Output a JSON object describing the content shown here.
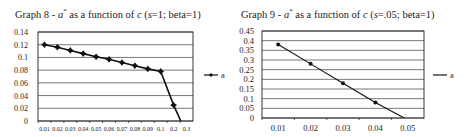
{
  "chart_data": [
    {
      "type": "line",
      "title": "Graph 8 - a* as a function of c (s=1; beta=1)",
      "title_parts": {
        "prefix": "Graph 8 - ",
        "var": "a",
        "sup": "*",
        "mid": " as a function of ",
        "cvar": "c",
        "paren_open": " (",
        "svar": "s",
        "params": "=1; beta=1)"
      },
      "xlabel": "",
      "ylabel": "",
      "categories": [
        "0.01",
        "0.02",
        "0.03",
        "0.04",
        "0.05",
        "0.06",
        "0.07",
        "0.08",
        "0.09",
        "0.1",
        "0.2",
        "0.3"
      ],
      "series": [
        {
          "name": "a",
          "values": [
            0.12,
            0.116,
            0.111,
            0.106,
            0.101,
            0.097,
            0.092,
            0.087,
            0.082,
            0.078,
            0.025,
            -0.02
          ]
        }
      ],
      "yticks": [
        "0",
        "0.02",
        "0.04",
        "0.06",
        "0.08",
        "0.1",
        "0.12",
        "0.14"
      ],
      "ylim": [
        0,
        0.14
      ],
      "grid": true,
      "legend_position": "right"
    },
    {
      "type": "line",
      "title": "Graph 9 - a* as a function of c (s=.05; beta=1)",
      "title_parts": {
        "prefix": "Graph 9 - ",
        "var": "a",
        "sup": "*",
        "mid": " as a function of ",
        "cvar": "c",
        "paren_open": " (",
        "svar": "s",
        "params": "=.05; beta=1)"
      },
      "xlabel": "",
      "ylabel": "",
      "categories": [
        "0.01",
        "0.02",
        "0.03",
        "0.04",
        "0.05"
      ],
      "series": [
        {
          "name": "a",
          "values": [
            0.38,
            0.28,
            0.18,
            0.08,
            -0.01
          ]
        }
      ],
      "yticks": [
        "0",
        "0.05",
        "0.1",
        "0.15",
        "0.2",
        "0.25",
        "0.3",
        "0.35",
        "0.4",
        "0.45"
      ],
      "ylim": [
        0,
        0.45
      ],
      "grid": true,
      "legend_position": "right"
    }
  ],
  "legend": {
    "label": "a"
  }
}
